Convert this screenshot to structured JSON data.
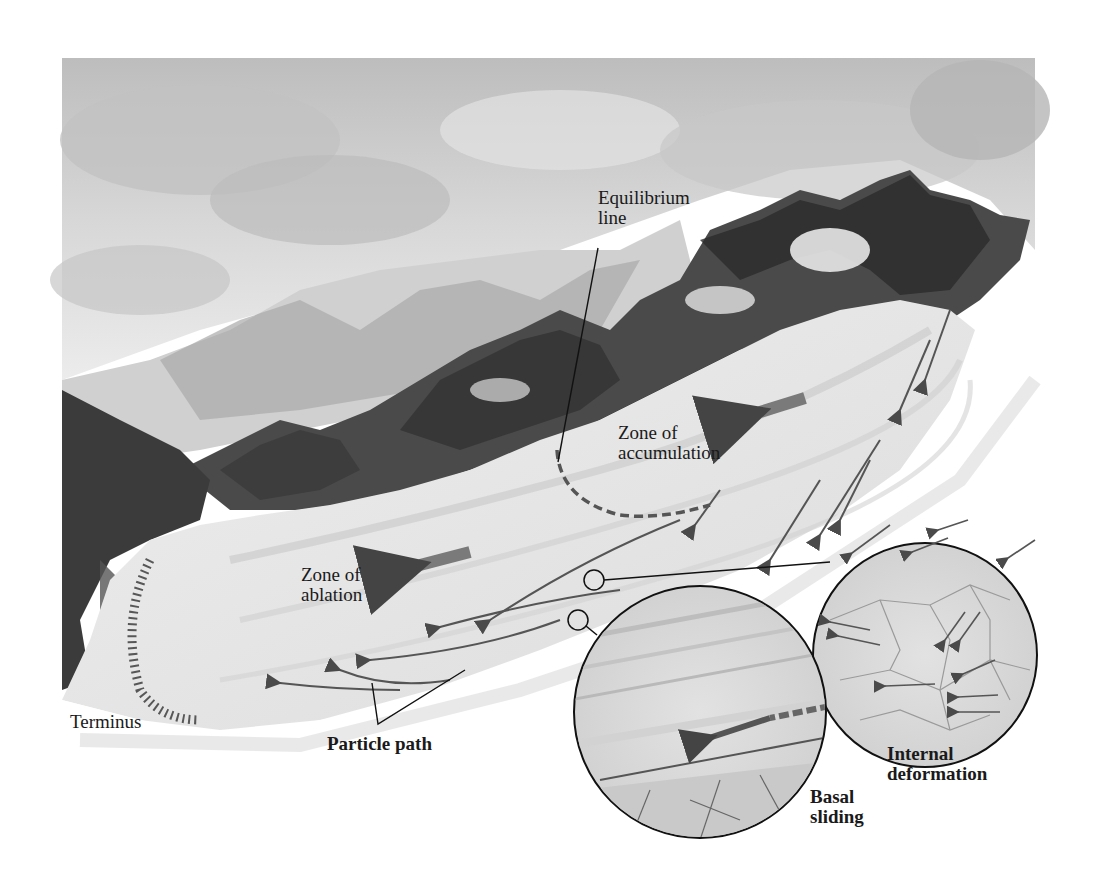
{
  "figure": {
    "colors": {
      "background": "#ffffff",
      "sky": "#c9c9c9",
      "rock": "#2e2e2e",
      "ice": "#e6e6e6",
      "arrow": "#555555",
      "line": "#111111"
    }
  },
  "labels": {
    "equilibrium_line": [
      "Equilibrium",
      "line"
    ],
    "zone_accumulation": [
      "Zone of",
      "accumulation"
    ],
    "zone_ablation": [
      "Zone of",
      "ablation"
    ],
    "terminus": "Terminus",
    "particle_path": "Particle path",
    "internal_deformation": [
      "Internal",
      "deformation"
    ],
    "basal_sliding": [
      "Basal",
      "sliding"
    ]
  },
  "insets": [
    {
      "id": "internal-deformation",
      "caption": "Internal deformation",
      "cx": 925,
      "cy": 655,
      "r": 112
    },
    {
      "id": "basal-sliding",
      "caption": "Basal sliding",
      "cx": 700,
      "cy": 712,
      "r": 126
    }
  ]
}
